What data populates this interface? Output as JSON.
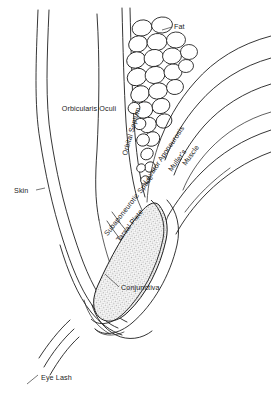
{
  "figure": {
    "background_color": "#ffffff",
    "line_color": "#1f1f1f",
    "shading_color": "#a9a9a9"
  },
  "labels": {
    "fat": "Fat",
    "orbicularis_oculi": "Orbicularis Oculi",
    "orbital_septum": "Orbital Septum",
    "levator_aponeurosis": "Levator Aponeurosis",
    "mullers": "Muller's",
    "muscle": "Muscle",
    "subaponeurotic_space": "Subaponeurotic Space",
    "tarsal_plate": "Tarsal Plate",
    "skin": "Skin",
    "conjunctiva": "Conjunctiva",
    "eye_lash": "Eye Lash"
  },
  "structures": [
    {
      "name": "skin",
      "label": "Skin",
      "kind": "outline"
    },
    {
      "name": "orbicularis-oculi",
      "label": "Orbicularis Oculi",
      "kind": "muscle-body"
    },
    {
      "name": "orbital-septum",
      "label": "Orbital Septum",
      "kind": "membrane"
    },
    {
      "name": "preaponeurotic-fat",
      "label": "Fat",
      "kind": "globule-cluster",
      "globule_count": 28
    },
    {
      "name": "levator-aponeurosis",
      "label": "Levator Aponeurosis",
      "kind": "aponeurosis"
    },
    {
      "name": "mullers-muscle",
      "label": "Muller's Muscle",
      "kind": "smooth-muscle"
    },
    {
      "name": "subaponeurotic-space",
      "label": "Subaponeurotic Space",
      "kind": "potential-space"
    },
    {
      "name": "tarsal-plate",
      "label": "Tarsal Plate",
      "kind": "shaded-plate"
    },
    {
      "name": "conjunctiva",
      "label": "Conjunctiva",
      "kind": "membrane"
    },
    {
      "name": "eye-lash",
      "label": "Eye Lash",
      "kind": "lash-lines",
      "lash_count": 3
    }
  ]
}
